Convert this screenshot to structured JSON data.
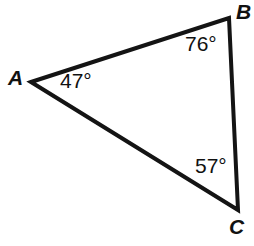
{
  "figure": {
    "type": "triangle-diagram",
    "background_color": "#ffffff",
    "stroke_color": "#141414",
    "text_color": "#111111",
    "stroke_width": 4,
    "width": 254,
    "height": 246
  },
  "vertices": [
    {
      "name": "A",
      "label": "A",
      "x": 31,
      "y": 82
    },
    {
      "name": "B",
      "label": "B",
      "x": 229,
      "y": 18
    },
    {
      "name": "C",
      "label": "C",
      "x": 238,
      "y": 210
    }
  ],
  "angles": [
    {
      "at": "A",
      "label": "47°",
      "value": 47,
      "unit": "degrees"
    },
    {
      "at": "B",
      "label": "76°",
      "value": 76,
      "unit": "degrees"
    },
    {
      "at": "C",
      "label": "57°",
      "value": 57,
      "unit": "degrees"
    }
  ],
  "edges": [
    {
      "name": "AB",
      "from": "A",
      "to": "B"
    },
    {
      "name": "BC",
      "from": "B",
      "to": "C"
    },
    {
      "name": "CA",
      "from": "C",
      "to": "A"
    }
  ],
  "paths": {
    "triangle": "M 31 82 L 229 18 L 238 210 Z"
  }
}
